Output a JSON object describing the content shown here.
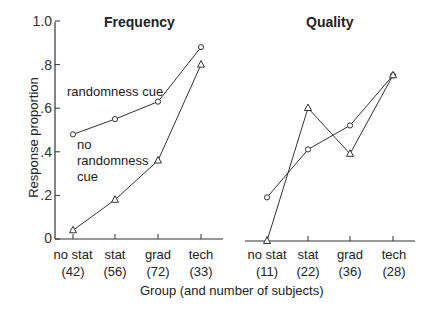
{
  "chart_data": [
    {
      "type": "line",
      "title": "Frequency",
      "xlabel": "Group (and number of subjects)",
      "ylabel": "Response proportion",
      "ylim": [
        0,
        1.0
      ],
      "yticks": [
        "0",
        ".2",
        ".4",
        ".6",
        ".8",
        "1.0"
      ],
      "categories": [
        "no stat",
        "stat",
        "grad",
        "tech"
      ],
      "category_n": [
        "(42)",
        "(56)",
        "(72)",
        "(33)"
      ],
      "series": [
        {
          "name": "randomness cue",
          "marker": "circle",
          "values": [
            0.48,
            0.55,
            0.63,
            0.88
          ]
        },
        {
          "name": "no randomness cue",
          "marker": "triangle",
          "values": [
            0.04,
            0.18,
            0.36,
            0.8
          ]
        }
      ],
      "annotations": [
        "randomness cue",
        "no randomness cue"
      ],
      "grid": false
    },
    {
      "type": "line",
      "title": "Quality",
      "xlabel": "Group (and number of subjects)",
      "ylabel": "Response proportion",
      "ylim": [
        0,
        1.0
      ],
      "categories": [
        "no stat",
        "stat",
        "grad",
        "tech"
      ],
      "category_n": [
        "(11)",
        "(22)",
        "(36)",
        "(28)"
      ],
      "series": [
        {
          "name": "randomness cue",
          "marker": "circle",
          "values": [
            0.2,
            0.42,
            0.53,
            0.76
          ]
        },
        {
          "name": "no randomness cue",
          "marker": "triangle",
          "values": [
            0.0,
            0.61,
            0.4,
            0.76
          ]
        }
      ],
      "grid": false
    }
  ],
  "labels": {
    "ylabel": "Response proportion",
    "xlabel": "Group (and number of subjects)",
    "left_title": "Frequency",
    "right_title": "Quality",
    "annot_cue": "randomness cue",
    "annot_nocue_1": "no",
    "annot_nocue_2": "randomness",
    "annot_nocue_3": "cue",
    "yticks": [
      "1.0",
      ".8",
      ".6",
      ".4",
      ".2",
      "0"
    ],
    "left_cats": [
      "no stat",
      "stat",
      "grad",
      "tech"
    ],
    "left_n": [
      "(42)",
      "(56)",
      "(72)",
      "(33)"
    ],
    "right_cats": [
      "no stat",
      "stat",
      "grad",
      "tech"
    ],
    "right_n": [
      "(11)",
      "(22)",
      "(36)",
      "(28)"
    ]
  }
}
